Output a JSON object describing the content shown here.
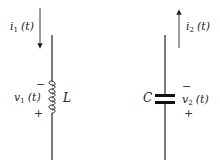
{
  "diagram": {
    "inductor": {
      "element_symbol": "L",
      "current": {
        "var": "i",
        "sub": "1",
        "arg": "(t)",
        "direction": "down"
      },
      "voltage": {
        "var": "v",
        "sub": "1",
        "arg": "(t)",
        "top_sign": "−",
        "bottom_sign": "+"
      }
    },
    "capacitor": {
      "element_symbol": "C",
      "current": {
        "var": "i",
        "sub": "2",
        "arg": "(t)",
        "direction": "up"
      },
      "voltage": {
        "var": "v",
        "sub": "2",
        "arg": "(t)",
        "top_sign": "−",
        "bottom_sign": "+"
      }
    }
  },
  "colors": {
    "stroke": "#222222",
    "background": "#ffffff"
  }
}
